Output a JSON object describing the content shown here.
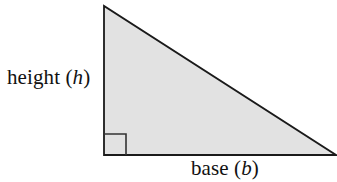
{
  "figure": {
    "name": "right-triangle-area-diagram",
    "background_color": "#ffffff",
    "triangle": {
      "shape": "right-triangle",
      "fill_color": "#e2e2e2",
      "stroke_color": "#1a1a1a",
      "stroke_width": 1.8,
      "vertices": {
        "apex": [
          104,
          6
        ],
        "bottom_left": [
          104,
          155
        ],
        "bottom_right": [
          336,
          155
        ]
      },
      "right_angle_marker": {
        "corner": "bottom-left",
        "size": 22,
        "stroke_color": "#333333",
        "stroke_width": 1.6
      }
    },
    "labels": {
      "height": {
        "text_prefix": "height (",
        "variable": "h",
        "text_suffix": ")",
        "full_text": "height (h)",
        "position": "left-of-vertical-leg"
      },
      "base": {
        "text_prefix": "base (",
        "variable": "b",
        "text_suffix": ")",
        "full_text": "base (b)",
        "position": "below-horizontal-leg"
      }
    }
  }
}
